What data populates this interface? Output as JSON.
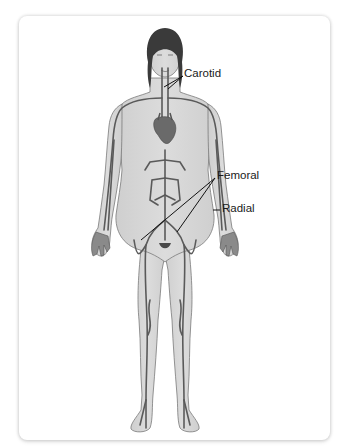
{
  "diagram": {
    "colors": {
      "skin": "#d3d3d3",
      "skin_outline": "#7a7a7a",
      "hair": "#3a3a3a",
      "vessel": "#5a5a5a",
      "heart": "#6a6a6a",
      "label_text": "#1a1a1a",
      "leader_line": "#111111",
      "card_background": "#ffffff"
    },
    "labels": [
      {
        "id": "carotid",
        "text": "Carotid",
        "x": 184,
        "y": 74
      },
      {
        "id": "femoral",
        "text": "Femoral",
        "x": 217,
        "y": 176
      },
      {
        "id": "radial",
        "text": "Radial",
        "x": 222,
        "y": 209
      }
    ]
  }
}
